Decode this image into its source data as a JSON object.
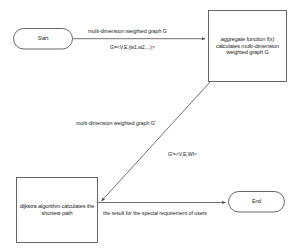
{
  "diagram": {
    "colors": {
      "stroke": "#4d4d4d",
      "text": "#1a1a1a",
      "background": "#ffffff"
    },
    "nodes": {
      "start": {
        "label": "Start",
        "shape": "terminal"
      },
      "aggregate": {
        "label": "aggregate function f(x) calculates multi-dimension weighted graph G",
        "shape": "process"
      },
      "dijkstra": {
        "label": "dijkstra algorithm calculates the shortest path",
        "shape": "process"
      },
      "end": {
        "label": "End",
        "shape": "terminal"
      }
    },
    "edges": {
      "start_to_aggregate": {
        "label": "multi-dimension weighted graph G",
        "formula": "G=<V,E,{w1,w2,...}>"
      },
      "aggregate_to_dijkstra": {
        "label": "multi-dimension weighted graph G'",
        "formula": "G'=<V,E,Wf>"
      },
      "dijkstra_to_end": {
        "label": "the result for the special requirement of users"
      }
    }
  }
}
